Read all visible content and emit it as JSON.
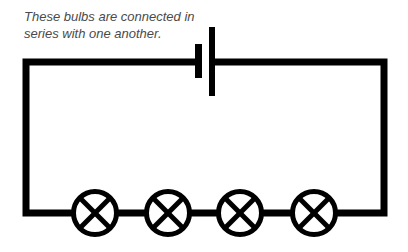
{
  "caption": {
    "line1": "These bulbs are connected in",
    "line2": "series with one another."
  },
  "diagram": {
    "type": "series-circuit",
    "components": {
      "battery": {
        "count": 1,
        "icon": "battery-cell-icon"
      },
      "bulbs": [
        {
          "id": 1,
          "icon": "lamp-bulb-icon"
        },
        {
          "id": 2,
          "icon": "lamp-bulb-icon"
        },
        {
          "id": 3,
          "icon": "lamp-bulb-icon"
        },
        {
          "id": 4,
          "icon": "lamp-bulb-icon"
        }
      ]
    },
    "colors": {
      "wire": "#000000",
      "text": "#4a4a4a",
      "background": "#ffffff"
    }
  }
}
